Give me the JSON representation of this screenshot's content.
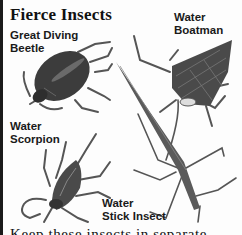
{
  "page": {
    "title": "Fierce Insects",
    "labels": {
      "great_diving_beetle": [
        "Great Diving",
        "Beetle"
      ],
      "water_boatman": [
        "Water",
        "Boatman"
      ],
      "water_scorpion": [
        "Water",
        "Scorpion"
      ],
      "water_stick_insect": [
        "Water",
        "Stick Insect"
      ]
    },
    "footer_text": "Keep these insects in separate"
  },
  "illustrations": [
    {
      "name": "great-diving-beetle",
      "color": "#3a3a3a"
    },
    {
      "name": "water-boatman",
      "color": "#444444"
    },
    {
      "name": "water-scorpion",
      "color": "#4a4a4a"
    },
    {
      "name": "water-stick-insect",
      "color": "#555555"
    }
  ]
}
